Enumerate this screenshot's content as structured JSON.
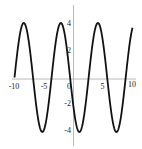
{
  "chart_data": {
    "type": "line",
    "title": "",
    "xlabel": "",
    "ylabel": "",
    "xlim": [
      -10,
      10
    ],
    "ylim": [
      -4,
      4
    ],
    "grid": false,
    "legend": null,
    "x_ticks": [
      -10,
      -5,
      0,
      5,
      10
    ],
    "x_tick_labels": [
      "-10",
      "-5",
      "0",
      "5",
      "10"
    ],
    "y_ticks": [
      4,
      2,
      -2,
      -4
    ],
    "y_tick_labels": [
      "4",
      "2",
      "-2",
      "-4"
    ],
    "series": [
      {
        "name": "y = 4 sin(x + 10)",
        "function": "4*sin(x+10)",
        "amplitude": 4,
        "period": 6.283,
        "color": "#111111",
        "x": [
          -10,
          -8.43,
          -6.86,
          -5.29,
          -3.72,
          -2.15,
          -0.58,
          0.99,
          2.57,
          4.14,
          5.71,
          7.28,
          8.85,
          10
        ],
        "y": [
          0,
          4,
          0,
          -4,
          0,
          4,
          0,
          -4,
          0,
          4,
          0,
          -4,
          0,
          3.64
        ]
      }
    ]
  },
  "colors": {
    "curve": "#111111",
    "axis": "#a8a8a8",
    "background": "#ffffff"
  }
}
